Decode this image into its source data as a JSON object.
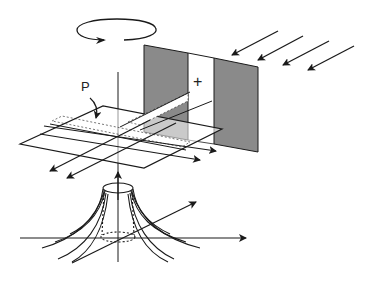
{
  "diagram": {
    "type": "physics-illustration",
    "labels": {
      "plane_label": "P",
      "charge_symbol": "+"
    },
    "elements": [
      {
        "name": "rotation-arrow",
        "description": "elliptical arrow indicating rotation about vertical axis"
      },
      {
        "name": "vertical-axis",
        "description": "vertical axis line with upward arrow"
      },
      {
        "name": "gray-panel",
        "description": "shaded vertical plate with a white slit containing '+'"
      },
      {
        "name": "incident-arrows",
        "count": 4,
        "description": "parallel arrows from upper right toward panel"
      },
      {
        "name": "horizontal-plane-P",
        "description": "horizontal parallelogram plane labeled P with dotted band"
      },
      {
        "name": "plane-arrows",
        "count": 4,
        "description": "arrows lying in plane P"
      },
      {
        "name": "field-lines",
        "description": "flaring field lines around a cylinder at base"
      },
      {
        "name": "coordinate-axes",
        "description": "horizontal axis and diagonal axis at base"
      }
    ],
    "colors": {
      "line": "#1a1a1a",
      "panel_fill": "#8a8a8a",
      "background": "#ffffff"
    }
  }
}
